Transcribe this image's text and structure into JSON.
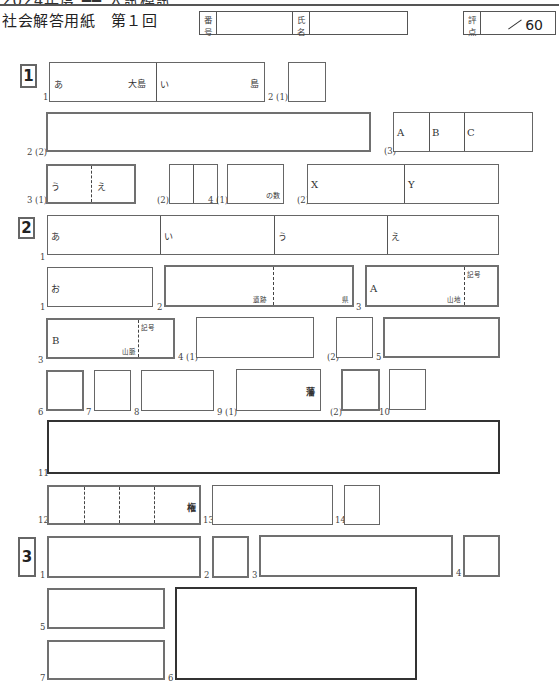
{
  "header": {
    "clipped_top_text": "2024年度 ━━ 入試模試",
    "title": "社会解答用紙　第１回",
    "number_label_1": "番",
    "number_label_2": "号",
    "name_label_1": "氏",
    "name_label_2": "名",
    "score_label_1": "評",
    "score_label_2": "点",
    "score_max": "60"
  },
  "sections": [
    {
      "id": "1",
      "questions": [
        {
          "num": "1",
          "cells": [
            {
              "prefix": "あ",
              "suffix": "大島"
            },
            {
              "prefix": "い",
              "suffix": "島"
            }
          ]
        },
        {
          "num": "2 (1)"
        },
        {
          "num": "2 (2)"
        },
        {
          "num": "(3)",
          "cells": [
            {
              "prefix": "A"
            },
            {
              "prefix": "B"
            },
            {
              "prefix": "C"
            }
          ]
        },
        {
          "num": "3 (1)",
          "cells": [
            {
              "prefix": "う"
            },
            {
              "prefix": "え"
            }
          ]
        },
        {
          "num": "(2)"
        },
        {
          "num": "4 (1)",
          "suffix": "の数"
        },
        {
          "num": "(2)",
          "cells": [
            {
              "prefix": "X"
            },
            {
              "prefix": "Y"
            }
          ]
        }
      ]
    },
    {
      "id": "2",
      "questions": [
        {
          "num": "1",
          "cells": [
            {
              "prefix": "あ"
            },
            {
              "prefix": "い"
            },
            {
              "prefix": "う"
            },
            {
              "prefix": "え"
            }
          ]
        },
        {
          "num": "1",
          "cells": [
            {
              "prefix": "お"
            }
          ]
        },
        {
          "num": "2",
          "suffix_left": "遺跡",
          "suffix_right": "県"
        },
        {
          "num": "3",
          "prefix": "A",
          "suffix": "山地",
          "code_label": "記号"
        },
        {
          "num": "3",
          "prefix": "B",
          "suffix": "山脈",
          "code_label": "記号"
        },
        {
          "num": "4 (1)"
        },
        {
          "num": "(2)"
        },
        {
          "num": "5"
        },
        {
          "num": "6"
        },
        {
          "num": "7"
        },
        {
          "num": "8"
        },
        {
          "num": "9 (1)",
          "suffix": "藩"
        },
        {
          "num": "(2)"
        },
        {
          "num": "10"
        },
        {
          "num": "11"
        },
        {
          "num": "12",
          "suffix": "権"
        },
        {
          "num": "13"
        },
        {
          "num": "14"
        }
      ]
    },
    {
      "id": "3",
      "questions": [
        {
          "num": "1"
        },
        {
          "num": "2"
        },
        {
          "num": "3"
        },
        {
          "num": "4"
        },
        {
          "num": "5"
        },
        {
          "num": "6"
        },
        {
          "num": "7"
        }
      ]
    }
  ]
}
